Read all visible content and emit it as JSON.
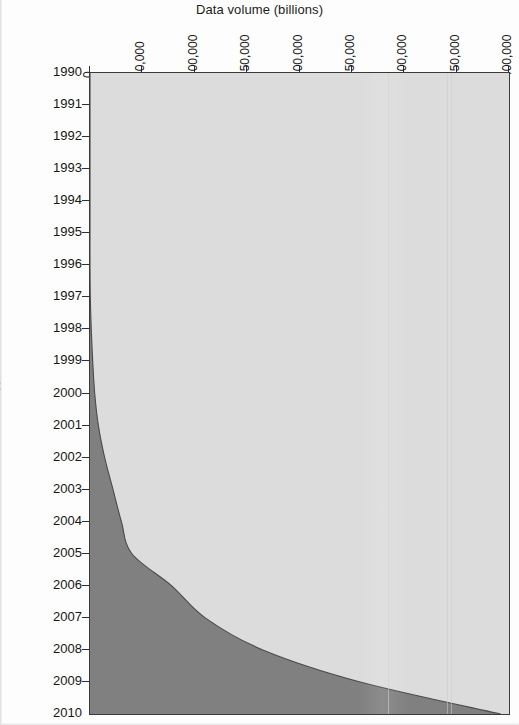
{
  "chart_data": {
    "type": "area",
    "title": "Data volume (billions)",
    "xlabel": "Data volume (billions)",
    "ylabel": "Year",
    "orientation": "horizontal-stacked-area",
    "grid": false,
    "legend": "none",
    "xlim": [
      0,
      400000
    ],
    "ylim": [
      1990,
      2010
    ],
    "x_ticks": [
      0,
      50000,
      100000,
      150000,
      200000,
      250000,
      300000,
      350000,
      400000
    ],
    "x_tick_labels": [
      "0",
      "50,000",
      "100,000",
      "150,000",
      "200,000",
      "250,000",
      "300,000",
      "350,000",
      "400,000"
    ],
    "y_ticks": [
      1990,
      1991,
      1992,
      1993,
      1994,
      1995,
      1996,
      1997,
      1998,
      1999,
      2000,
      2001,
      2002,
      2003,
      2004,
      2005,
      2006,
      2007,
      2008,
      2009,
      2010
    ],
    "y_tick_labels": [
      "1990",
      "1991",
      "1992",
      "1993",
      "1994",
      "1995",
      "1996",
      "1997",
      "1998",
      "1999",
      "2000",
      "2001",
      "2002",
      "2003",
      "2004",
      "2005",
      "2006",
      "2007",
      "2008",
      "2009",
      "2010"
    ],
    "years": [
      1990,
      1991,
      1992,
      1993,
      1994,
      1995,
      1996,
      1997,
      1998,
      1999,
      2000,
      2001,
      2002,
      2003,
      2004,
      2005,
      2006,
      2007,
      2008,
      2009,
      2010
    ],
    "series": [
      {
        "name": "dark-region",
        "color": "#808080",
        "values": [
          0,
          0,
          0,
          0,
          0,
          0,
          0,
          300,
          1200,
          2600,
          4500,
          8000,
          14000,
          22000,
          30000,
          40000,
          78000,
          110000,
          165000,
          258000,
          392000
        ]
      },
      {
        "name": "light-region",
        "color": "#dcdcdc",
        "values": [
          400000,
          400000,
          400000,
          400000,
          400000,
          400000,
          400000,
          399700,
          398800,
          397400,
          395500,
          392000,
          386000,
          378000,
          370000,
          360000,
          322000,
          290000,
          235000,
          142000,
          8000
        ]
      }
    ],
    "total": 400000,
    "colors": {
      "dark": "#808080",
      "light": "#dcdcdc",
      "axis": "#2e2e2e",
      "text": "#171717",
      "background": "#ffffff"
    }
  },
  "axes": {
    "x_title": "Data volume (billions)",
    "y_title": "Year"
  }
}
